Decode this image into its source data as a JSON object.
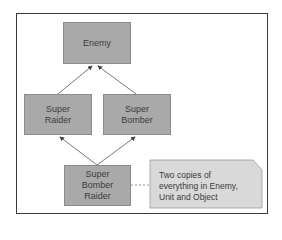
{
  "diagram": {
    "nodes": {
      "enemy": {
        "line1": "Enemy"
      },
      "super_raider": {
        "line1": "Super",
        "line2": "Raider"
      },
      "super_bomber": {
        "line1": "Super",
        "line2": "Bomber"
      },
      "super_bomber_raider": {
        "line1": "Super",
        "line2": "Bomber",
        "line3": "Raider"
      }
    },
    "note": {
      "line1": "Two copies of",
      "line2": "everything in Enemy,",
      "line3": "Unit and Object"
    },
    "edges": [
      {
        "from": "super_raider",
        "to": "enemy",
        "style": "arrow"
      },
      {
        "from": "super_bomber",
        "to": "enemy",
        "style": "arrow"
      },
      {
        "from": "super_bomber_raider",
        "to": "super_raider",
        "style": "arrow"
      },
      {
        "from": "super_bomber_raider",
        "to": "super_bomber",
        "style": "arrow"
      },
      {
        "from": "super_bomber_raider",
        "to": "note",
        "style": "dashed"
      }
    ],
    "colors": {
      "node_fill": "#a9a9a9",
      "note_fill": "#d9d9d9",
      "frame": "#3a3a3a",
      "edge": "#555555"
    }
  }
}
